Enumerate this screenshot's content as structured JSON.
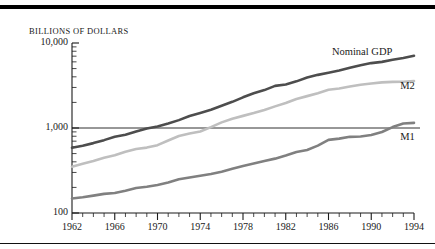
{
  "figure": {
    "y_axis_title": "BILLIONS OF DOLLARS"
  },
  "chart_data": {
    "type": "line",
    "title": "",
    "subtitle": "",
    "xlabel": "",
    "ylabel": "BILLIONS OF DOLLARS",
    "yscale": "log",
    "ylim": [
      100,
      10000
    ],
    "xlim": [
      1962,
      1994
    ],
    "grid": false,
    "gridlines_shown": [
      1000
    ],
    "legend_position": "inline-right",
    "ytick_labels": [
      "10,000",
      "1,000",
      "100"
    ],
    "ytick_values": [
      10000,
      1000,
      100
    ],
    "xtick_labels": [
      "1962",
      "1966",
      "1970",
      "1974",
      "1978",
      "1982",
      "1986",
      "1990",
      "1994"
    ],
    "xtick_values": [
      1962,
      1966,
      1970,
      1974,
      1978,
      1982,
      1986,
      1990,
      1994
    ],
    "x_minor_tick_interval": 1,
    "x": [
      1962,
      1963,
      1964,
      1965,
      1966,
      1967,
      1968,
      1969,
      1970,
      1971,
      1972,
      1973,
      1974,
      1975,
      1976,
      1977,
      1978,
      1979,
      1980,
      1981,
      1982,
      1983,
      1984,
      1985,
      1986,
      1987,
      1988,
      1989,
      1990,
      1991,
      1992,
      1993,
      1994
    ],
    "series": [
      {
        "name": "Nominal GDP",
        "label": "Nominal GDP",
        "color": "#4d4d4d",
        "values": [
          586,
          619,
          664,
          720,
          788,
          833,
          910,
          985,
          1039,
          1129,
          1238,
          1383,
          1500,
          1638,
          1825,
          2031,
          2295,
          2563,
          2790,
          3128,
          3255,
          3537,
          3933,
          4220,
          4463,
          4740,
          5104,
          5484,
          5803,
          5996,
          6338,
          6667,
          7072
        ]
      },
      {
        "name": "M2",
        "label": "M2",
        "color": "#bfbfbf",
        "values": [
          350,
          379,
          410,
          447,
          477,
          525,
          567,
          588,
          628,
          713,
          806,
          861,
          908,
          1023,
          1164,
          1287,
          1389,
          1500,
          1633,
          1796,
          1965,
          2196,
          2372,
          2569,
          2812,
          2918,
          3072,
          3227,
          3339,
          3439,
          3487,
          3502,
          3565
        ]
      },
      {
        "name": "M1",
        "label": "M1",
        "color": "#808080",
        "values": [
          148,
          153,
          160,
          168,
          172,
          183,
          197,
          204,
          214,
          228,
          249,
          262,
          274,
          287,
          306,
          331,
          358,
          382,
          409,
          436,
          474,
          521,
          552,
          620,
          725,
          750,
          787,
          794,
          826,
          898,
          1025,
          1129,
          1150
        ]
      }
    ],
    "annotations": [
      {
        "text": "Nominal GDP",
        "x": 1989,
        "y": 7600
      },
      {
        "text": "M2",
        "x": 1993.2,
        "y": 3000
      },
      {
        "text": "M1",
        "x": 1993.2,
        "y": 760
      }
    ]
  }
}
